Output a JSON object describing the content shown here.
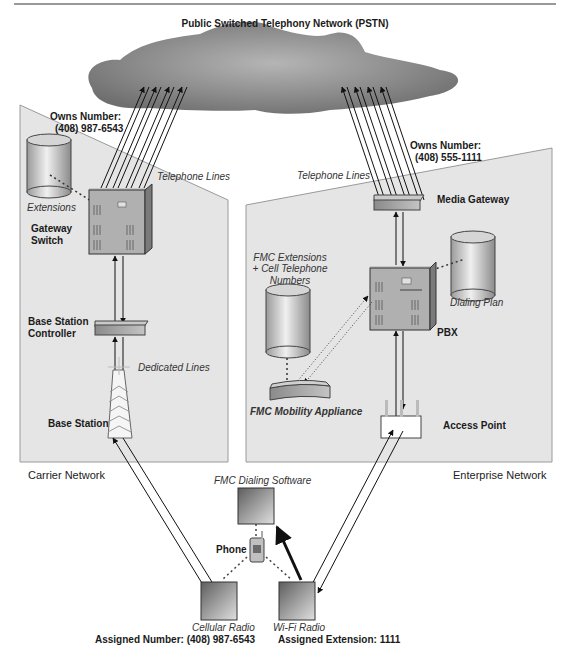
{
  "title": "Public Switched Telephony Network (PSTN)",
  "carrier": {
    "network_label": "Carrier Network",
    "owns_number_label": "Owns Number:",
    "owns_number_value": "(408) 987-6543",
    "extensions_label": "Extensions",
    "gateway_switch_label_1": "Gateway",
    "gateway_switch_label_2": "Switch",
    "telephone_lines_label": "Telephone Lines",
    "bsc_label_1": "Base Station",
    "bsc_label_2": "Controller",
    "dedicated_lines_label": "Dedicated Lines",
    "base_station_label": "Base Station"
  },
  "enterprise": {
    "network_label": "Enterprise Network",
    "owns_number_label": "Owns Number:",
    "owns_number_value": "(408) 555-1111",
    "telephone_lines_label": "Telephone Lines",
    "media_gateway_label": "Media Gateway",
    "fmc_ext_label_1": "FMC Extensions",
    "fmc_ext_label_2": "+ Cell Telephone",
    "fmc_ext_label_3": "Numbers",
    "dialing_plan_label": "Dialing Plan",
    "pbx_label": "PBX",
    "fmc_appliance_label": "FMC Mobility Appliance",
    "access_point_label": "Access Point"
  },
  "phone": {
    "dialing_software_label": "FMC Dialing Software",
    "phone_label": "Phone",
    "cellular_radio_label": "Cellular Radio",
    "wifi_radio_label": "Wi-Fi Radio",
    "assigned_number": "Assigned Number: (408) 987-6543",
    "assigned_extension": "Assigned Extension: 1111"
  },
  "colors": {
    "panel_fill": "#e4e4e4",
    "cloud_fill": "#8a8a8a",
    "device_fill": "#a0a0a0",
    "line": "#1a1a1a"
  }
}
